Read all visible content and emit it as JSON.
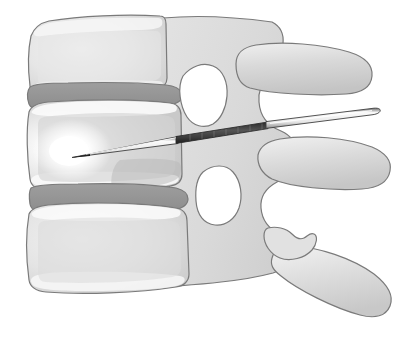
{
  "illustration": {
    "title": "Lateral lumbar spine with transpedicular needle placement",
    "subject": "lumbar-spine-sagittal-view",
    "background_color": "#ffffff",
    "outline_color": "#7a7a7a",
    "palette": {
      "bone_light": "#eaeaea",
      "bone_mid": "#d8d8d8",
      "bone_shadow": "#c2c2c2",
      "cortical_pale": "#f2f2f2",
      "disc_gray": "#989898",
      "disc_gray_dark": "#8c8c8c",
      "cancellous_gray": "#cfcfcf",
      "highlight_white": "#ffffff",
      "needle_shaft": "#f6f6f6",
      "needle_dark": "#3a3a3a",
      "needle_hub": "#1a1a1a",
      "needle_outline": "#4a4a4a"
    },
    "structures": [
      {
        "id": "vertebral-body-upper",
        "label": "Upper vertebral body",
        "level": "superior"
      },
      {
        "id": "intervertebral-disc-upper",
        "label": "Upper intervertebral disc",
        "level": "superior"
      },
      {
        "id": "vertebral-body-middle",
        "label": "Middle vertebral body (target)",
        "level": "target"
      },
      {
        "id": "intervertebral-disc-lower",
        "label": "Lower intervertebral disc",
        "level": "inferior"
      },
      {
        "id": "vertebral-body-lower",
        "label": "Lower vertebral body",
        "level": "inferior"
      },
      {
        "id": "posterior-column",
        "label": "Posterior elements / pedicle column",
        "level": "posterior"
      },
      {
        "id": "neural-foramen-upper",
        "label": "Upper intervertebral foramen",
        "level": "posterior"
      },
      {
        "id": "neural-foramen-lower",
        "label": "Lower intervertebral foramen",
        "level": "posterior"
      },
      {
        "id": "spinous-process-upper",
        "label": "Upper spinous process",
        "level": "posterior"
      },
      {
        "id": "spinous-process-middle",
        "label": "Middle spinous process",
        "level": "posterior"
      },
      {
        "id": "spinous-process-lower",
        "label": "Lower spinous process",
        "level": "posterior"
      },
      {
        "id": "needle",
        "label": "Injection needle",
        "level": "instrument"
      },
      {
        "id": "cement-highlight",
        "label": "Injected material highlight",
        "level": "instrument"
      }
    ],
    "needle": {
      "tip_x": 72,
      "tip_y": 157,
      "hub_x": 377,
      "hub_y": 110,
      "entry_note": "transpedicular, tip within anterior middle vertebral body"
    }
  }
}
